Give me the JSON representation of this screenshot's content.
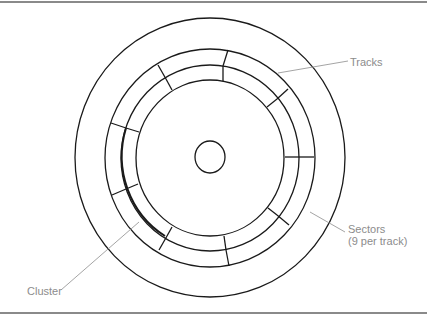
{
  "figure": {
    "labels": {
      "tracks": "Tracks",
      "sectors_line1": "Sectors",
      "sectors_line2": "(9 per track)",
      "cluster": "Cluster"
    },
    "sectors_per_track": 9,
    "colors": {
      "stroke": "#1a1a1a",
      "leader": "#9a9a9a",
      "label": "#8c8c8c",
      "rule": "#8a8a8a"
    }
  }
}
